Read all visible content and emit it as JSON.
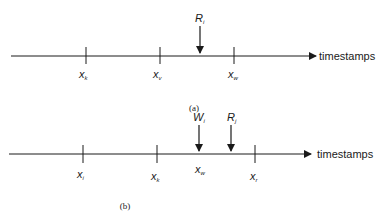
{
  "axis_label": "timestamps",
  "panel_a": {
    "caption": "(a)",
    "ticks": [
      {
        "base": "x",
        "sub": "k"
      },
      {
        "base": "x",
        "sub": "v"
      },
      {
        "base": "x",
        "sub": "w"
      }
    ],
    "arrows": [
      {
        "base": "R",
        "sub": "i"
      }
    ]
  },
  "panel_b": {
    "caption": "(b)",
    "ticks": [
      {
        "base": "x",
        "sub": "i"
      },
      {
        "base": "x",
        "sub": "k"
      },
      {
        "base": "x",
        "sub": "r"
      }
    ],
    "mid_label": {
      "base": "x",
      "sub": "w"
    },
    "arrows": [
      {
        "base": "W",
        "sub": "i"
      },
      {
        "base": "R",
        "sub": "j"
      }
    ]
  }
}
